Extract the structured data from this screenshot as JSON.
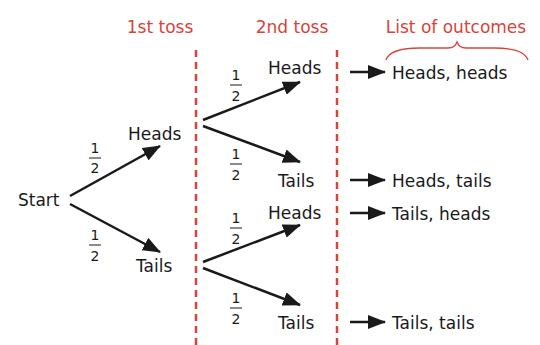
{
  "colors": {
    "accent": "#d9443a",
    "ink": "#1a1a1a",
    "background": "#ffffff"
  },
  "headers": {
    "first_toss": "1st toss",
    "second_toss": "2nd toss",
    "outcomes": "List of outcomes"
  },
  "root": {
    "label": "Start"
  },
  "first_toss": [
    {
      "label": "Heads",
      "probability": {
        "num": "1",
        "den": "2"
      }
    },
    {
      "label": "Tails",
      "probability": {
        "num": "1",
        "den": "2"
      }
    }
  ],
  "second_toss": [
    {
      "label": "Heads",
      "probability": {
        "num": "1",
        "den": "2"
      }
    },
    {
      "label": "Tails",
      "probability": {
        "num": "1",
        "den": "2"
      }
    },
    {
      "label": "Heads",
      "probability": {
        "num": "1",
        "den": "2"
      }
    },
    {
      "label": "Tails",
      "probability": {
        "num": "1",
        "den": "2"
      }
    }
  ],
  "outcomes": [
    "Heads, heads",
    "Heads, tails",
    "Tails, heads",
    "Tails, tails"
  ]
}
